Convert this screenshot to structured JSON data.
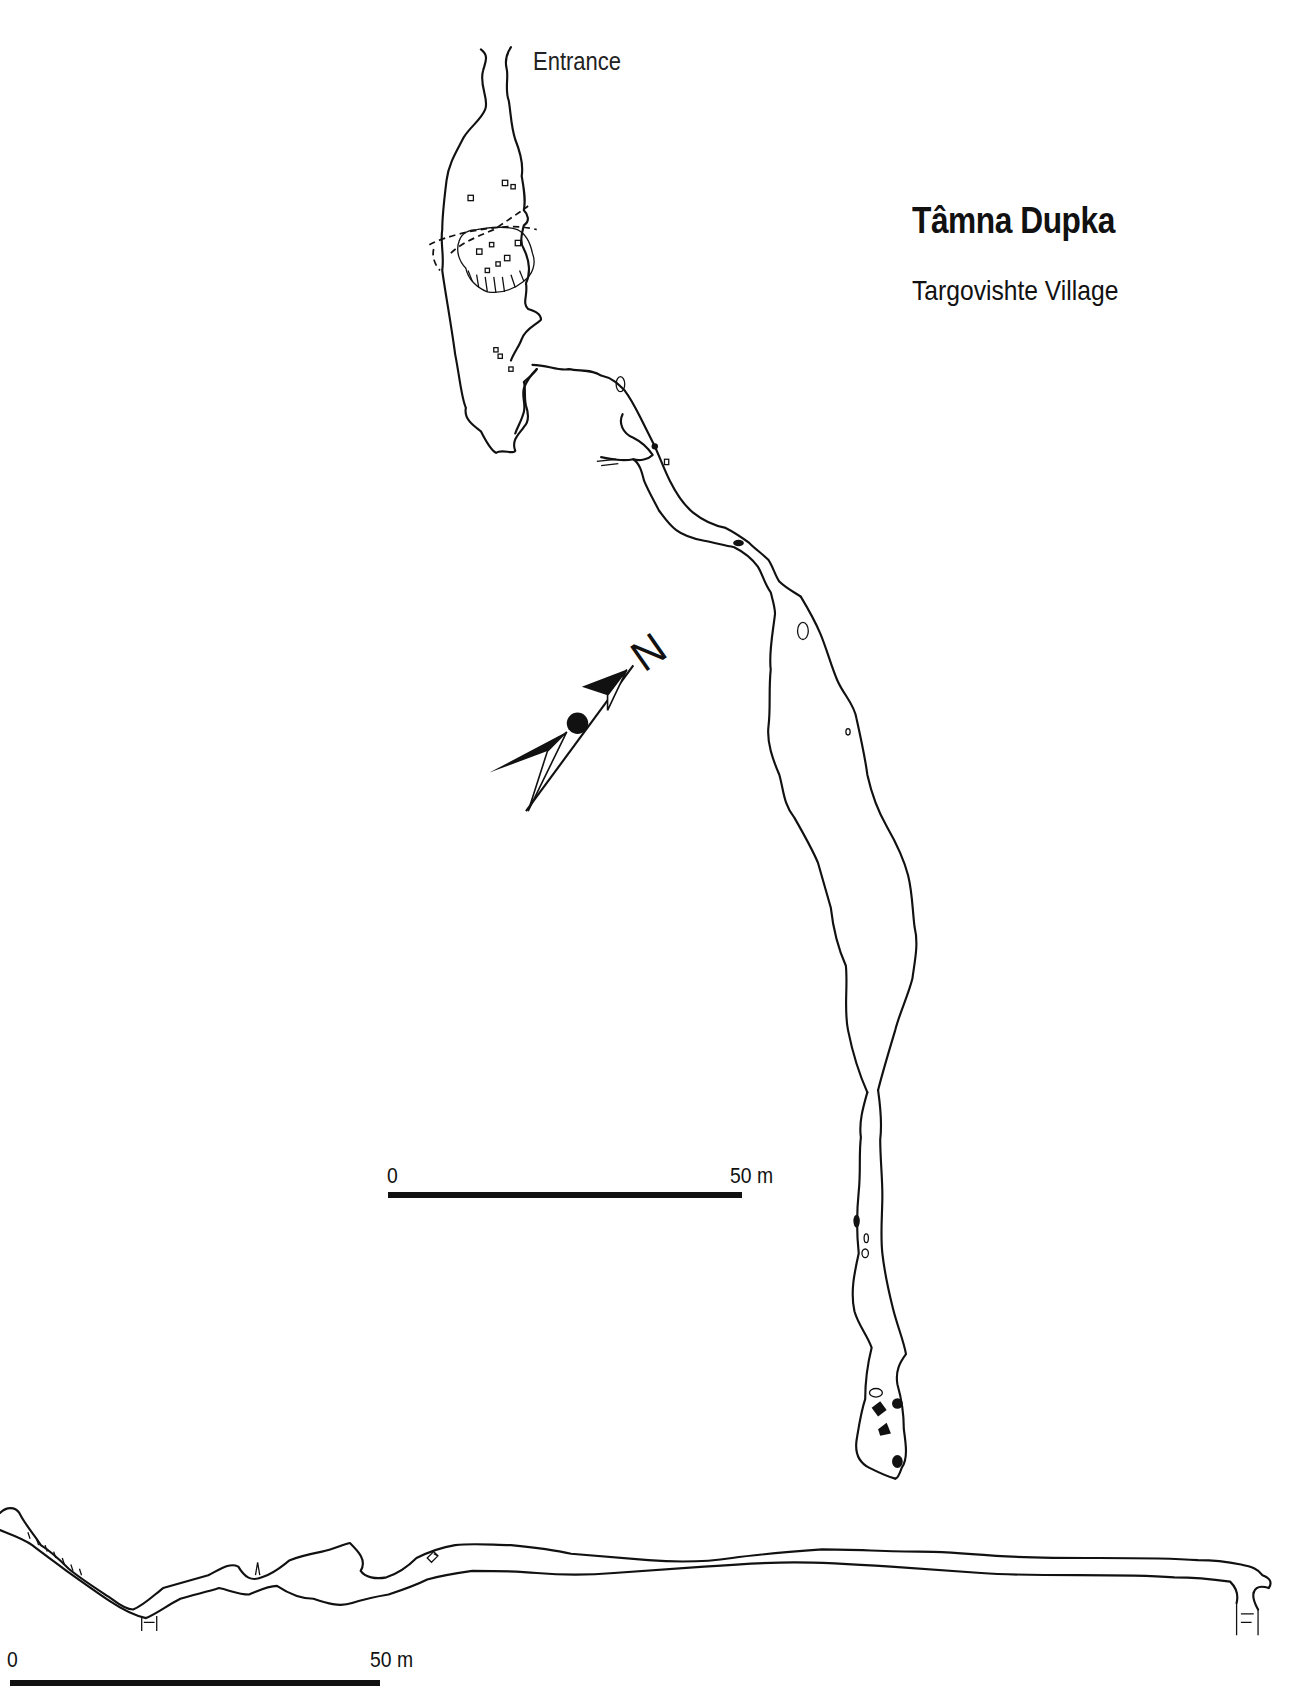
{
  "map": {
    "title": "Tâmna Dupka",
    "subtitle": "Targovishte Village",
    "entrance_label": "Entrance",
    "north_label": "N"
  },
  "plan_scale_bar": {
    "start_label": "0",
    "end_label": "50 m"
  },
  "profile_scale_bar": {
    "start_label": "0",
    "end_label": "50 m"
  },
  "views": [
    "plan",
    "profile"
  ],
  "colors": {
    "ink": "#111111",
    "background": "#ffffff"
  }
}
